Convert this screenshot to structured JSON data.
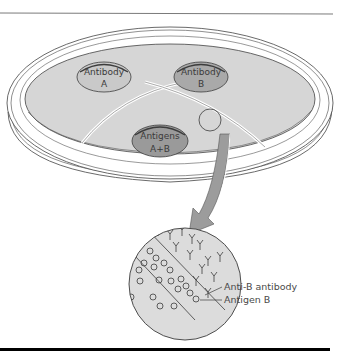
{
  "figure": {
    "type": "immunodiffusion-diagram",
    "wells": [
      {
        "id": "antibody-a",
        "line1": "Antibody",
        "line2": "A",
        "fill": "#c9c9c9"
      },
      {
        "id": "antibody-b",
        "line1": "Antibody",
        "line2": "B",
        "fill": "#a9a9a9"
      },
      {
        "id": "antigens-ab",
        "line1": "Antigens",
        "line2": "A+B",
        "fill": "#9a9a9a"
      }
    ],
    "inset_labels": {
      "antibody": "Anti-B antibody",
      "antigen": "Antigen B"
    },
    "colors": {
      "agar": "#d6d6d6",
      "inset": "#dcdcdc",
      "arrow": "#9c9c9c",
      "outline": "#3c3c3c",
      "rule_top": "#7a7a7a",
      "rule_bottom": "#000000"
    }
  }
}
